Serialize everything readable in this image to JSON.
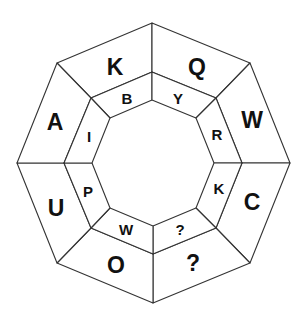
{
  "puzzle": {
    "type": "octagonal letter ring puzzle",
    "outer_ring": [
      {
        "position": "top-left",
        "letter": "K"
      },
      {
        "position": "top-right",
        "letter": "Q"
      },
      {
        "position": "right-upper",
        "letter": "W"
      },
      {
        "position": "right-lower",
        "letter": "C"
      },
      {
        "position": "bottom-right",
        "letter": "?"
      },
      {
        "position": "bottom-left",
        "letter": "O"
      },
      {
        "position": "left-lower",
        "letter": "U"
      },
      {
        "position": "left-upper",
        "letter": "A"
      }
    ],
    "middle_ring": [
      {
        "position": "top-left",
        "letter": "B"
      },
      {
        "position": "top-right",
        "letter": "Y"
      },
      {
        "position": "right-upper",
        "letter": "R"
      },
      {
        "position": "right-lower",
        "letter": "K"
      },
      {
        "position": "bottom-right",
        "letter": "?"
      },
      {
        "position": "bottom-left",
        "letter": "W"
      },
      {
        "position": "left-lower",
        "letter": "P"
      },
      {
        "position": "left-upper",
        "letter": "I"
      }
    ],
    "colors": {
      "stroke": "#333333",
      "text": "#111111",
      "background": "#ffffff"
    }
  }
}
